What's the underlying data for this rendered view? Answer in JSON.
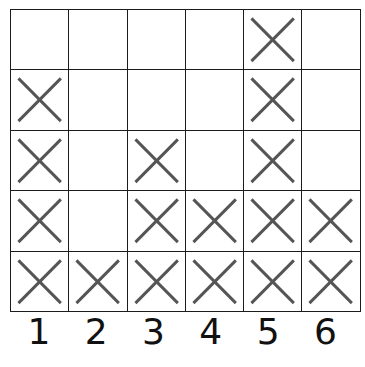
{
  "chart_data": {
    "type": "bar",
    "title": "",
    "subtitle": "",
    "xlabel": "",
    "ylabel": "",
    "categories": [
      "1",
      "2",
      "3",
      "4",
      "5",
      "6"
    ],
    "values": [
      4,
      1,
      3,
      2,
      5,
      2
    ],
    "ylim": [
      0,
      5
    ],
    "grid": true,
    "legend": null,
    "annotations": [],
    "mark_glyph": "X",
    "mark_color": "#555555",
    "grid_line_color": "#1c1c1c",
    "background_color": "#ffffff",
    "rows": 5,
    "columns": 6,
    "cells": [
      [
        false,
        false,
        false,
        false,
        true,
        false
      ],
      [
        true,
        false,
        false,
        false,
        true,
        false
      ],
      [
        true,
        false,
        true,
        false,
        true,
        false
      ],
      [
        true,
        false,
        true,
        true,
        true,
        true
      ],
      [
        true,
        true,
        true,
        true,
        true,
        true
      ]
    ]
  },
  "axis": {
    "x_tick_labels": [
      "1",
      "2",
      "3",
      "4",
      "5",
      "6"
    ]
  },
  "icons": {
    "x_mark": "x-mark-icon"
  }
}
